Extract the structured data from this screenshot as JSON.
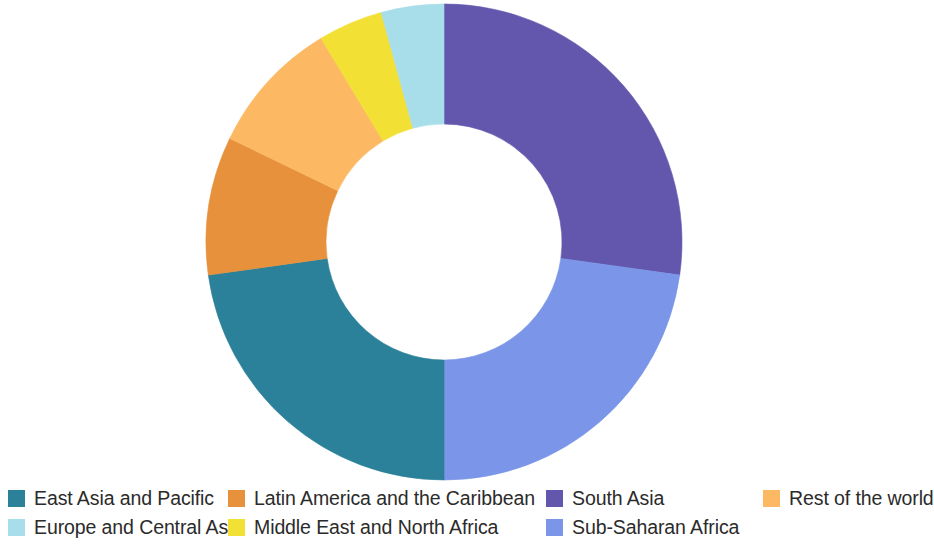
{
  "chart_data": {
    "type": "pie",
    "variant": "donut",
    "title": "",
    "subtitle": "",
    "xlabel": "",
    "ylabel": "",
    "legend_position": "bottom",
    "grid": false,
    "hole_ratio": 0.495,
    "start_angle_deg": 0,
    "direction": "clockwise",
    "categories": [
      "South Asia",
      "Sub-Saharan Africa",
      "East Asia and Pacific",
      "Latin America and the Caribbean",
      "Rest of the world",
      "Middle East and North Africa",
      "Europe and Central Asia"
    ],
    "values": [
      27.2,
      22.8,
      22.8,
      9.4,
      9.2,
      4.4,
      4.2
    ],
    "unit": "percent",
    "colors": [
      "#6257ad",
      "#7b96e8",
      "#2b8199",
      "#e8913c",
      "#fcb863",
      "#f2e034",
      "#a8ddea"
    ],
    "slices": [
      {
        "label": "South Asia",
        "value": 27.2,
        "color": "#6257ad",
        "start_deg": 0.0,
        "end_deg": 98.0
      },
      {
        "label": "Sub-Saharan Africa",
        "value": 22.8,
        "color": "#7b96e8",
        "start_deg": 98.0,
        "end_deg": 180.0
      },
      {
        "label": "East Asia and Pacific",
        "value": 22.8,
        "color": "#2b8199",
        "start_deg": 180.0,
        "end_deg": 262.0
      },
      {
        "label": "Latin America and the Caribbean",
        "value": 9.4,
        "color": "#e8913c",
        "start_deg": 262.0,
        "end_deg": 295.8
      },
      {
        "label": "Rest of the world",
        "value": 9.2,
        "color": "#fcb863",
        "start_deg": 295.8,
        "end_deg": 328.9
      },
      {
        "label": "Middle East and North Africa",
        "value": 4.4,
        "color": "#f2e034",
        "start_deg": 328.9,
        "end_deg": 344.7
      },
      {
        "label": "Europe and Central Asia",
        "value": 4.2,
        "color": "#a8ddea",
        "start_deg": 344.7,
        "end_deg": 360.0
      }
    ]
  },
  "legend": {
    "rows": [
      [
        {
          "label": "East Asia and Pacific",
          "color": "#2b8199"
        },
        {
          "label": "Latin America and the Caribbean",
          "color": "#e8913c"
        },
        {
          "label": "South Asia",
          "color": "#6257ad"
        },
        {
          "label": "Rest of the world",
          "color": "#fcb863"
        }
      ],
      [
        {
          "label": "Europe and Central Asia",
          "color": "#a8ddea"
        },
        {
          "label": "Middle East and North Africa",
          "color": "#f2e034"
        },
        {
          "label": "Sub-Saharan Africa",
          "color": "#7b96e8"
        }
      ]
    ]
  },
  "geometry": {
    "center_x": 444,
    "center_y": 242,
    "outer_radius": 238,
    "inner_radius": 118
  }
}
